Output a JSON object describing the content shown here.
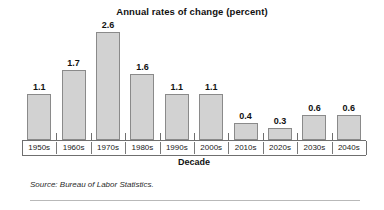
{
  "chart_data": {
    "type": "bar",
    "title": "Annual rates of change (percent)",
    "xlabel": "Decade",
    "ylabel": "",
    "categories": [
      "1950s",
      "1960s",
      "1970s",
      "1980s",
      "1990s",
      "2000s",
      "2010s",
      "2020s",
      "2030s",
      "2040s"
    ],
    "values": [
      1.1,
      1.7,
      2.6,
      1.6,
      1.1,
      1.1,
      0.4,
      0.3,
      0.6,
      0.6
    ],
    "value_labels": [
      "1.1",
      "1.7",
      "2.6",
      "1.6",
      "1.1",
      "1.1",
      "0.4",
      "0.3",
      "0.6",
      "0.6"
    ],
    "ylim": [
      0,
      2.8
    ],
    "grid": false,
    "legend": "none",
    "bar_fill_color": "#d2d2d2",
    "bar_border_color": "#8a8a8a",
    "axis_color": "#6f6f6f"
  },
  "source": {
    "text": "Source: Bureau of Labor Statistics."
  }
}
